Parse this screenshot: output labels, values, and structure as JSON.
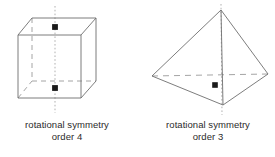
{
  "figure": {
    "background_color": "#ffffff",
    "solid_line_color": "#6e6e6e",
    "hidden_line_color": "#9a9a9a",
    "axis_line_color": "#a8a8a8",
    "marker_color": "#1a1a1a",
    "text_color": "#2b2b2b"
  },
  "shapes": [
    {
      "name": "cube",
      "label_lines": [
        "rotational symmetry",
        "order 4"
      ],
      "symmetry_order": 4,
      "axis": "vertical",
      "marker_points": [
        {
          "x": 55,
          "y": 27,
          "name": "top-face-centre-marker"
        },
        {
          "x": 55,
          "y": 88,
          "name": "bottom-face-centre-marker"
        }
      ],
      "vertices": {
        "front_top_left": {
          "x": 18,
          "y": 35
        },
        "front_top_right": {
          "x": 81,
          "y": 35
        },
        "front_bottom_left": {
          "x": 18,
          "y": 98
        },
        "front_bottom_right": {
          "x": 81,
          "y": 98
        },
        "back_top_left": {
          "x": 32,
          "y": 18
        },
        "back_top_right": {
          "x": 96,
          "y": 18
        },
        "back_bottom_left": {
          "x": 32,
          "y": 81
        },
        "back_bottom_right": {
          "x": 96,
          "y": 81
        }
      }
    },
    {
      "name": "triangular-pyramid",
      "label_lines": [
        "rotational symmetry",
        "order 3"
      ],
      "symmetry_order": 3,
      "axis": "vertical",
      "marker_points": [
        {
          "x": 215,
          "y": 85,
          "name": "base-centre-marker"
        }
      ],
      "vertices": {
        "apex": {
          "x": 221,
          "y": 10
        },
        "base_left": {
          "x": 152,
          "y": 76
        },
        "base_right": {
          "x": 268,
          "y": 74
        },
        "base_front": {
          "x": 223,
          "y": 105
        }
      }
    }
  ],
  "captions": {
    "cube": {
      "line1": "rotational symmetry",
      "line2": "order 4"
    },
    "pyramid": {
      "line1": "rotational symmetry",
      "line2": "order 3"
    }
  }
}
